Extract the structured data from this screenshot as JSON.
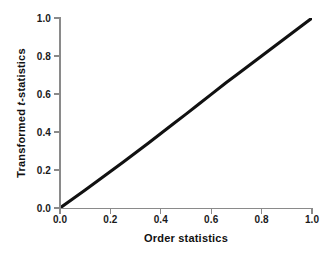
{
  "chart_data": {
    "type": "line",
    "title": "",
    "subtitle": "",
    "xlabel": "Order statistics",
    "ylabel": "Transformed t-statistics",
    "ylabel_parts": {
      "prefix": "Transformed ",
      "italic": "t",
      "suffix": "-statistics"
    },
    "xlim": [
      0.0,
      1.0
    ],
    "ylim": [
      0.0,
      1.0
    ],
    "xticks": [
      "0.0",
      "0.2",
      "0.4",
      "0.6",
      "0.8",
      "1.0"
    ],
    "yticks": [
      "0.0",
      "0.2",
      "0.4",
      "0.6",
      "0.8",
      "1.0"
    ],
    "xtick_values": [
      0.0,
      0.2,
      0.4,
      0.6,
      0.8,
      1.0
    ],
    "ytick_values": [
      0.0,
      0.2,
      0.4,
      0.6,
      0.8,
      1.0
    ],
    "grid": false,
    "legend": false,
    "legend_position": "none",
    "line_color": "#111111",
    "axis_color": "#8a8a8a",
    "background_color": "#ffffff",
    "annotations": [],
    "series": [
      {
        "name": "Transformed t-statistics vs order statistics",
        "x": [
          0.0,
          0.05,
          0.1,
          0.15,
          0.2,
          0.25,
          0.3,
          0.35,
          0.4,
          0.45,
          0.5,
          0.55,
          0.6,
          0.66,
          0.7,
          0.75,
          0.8,
          0.85,
          0.9,
          0.95,
          1.0
        ],
        "values": [
          0.0,
          0.047,
          0.095,
          0.143,
          0.192,
          0.241,
          0.291,
          0.341,
          0.392,
          0.443,
          0.494,
          0.546,
          0.598,
          0.661,
          0.7,
          0.75,
          0.8,
          0.85,
          0.9,
          0.95,
          1.0
        ]
      }
    ]
  },
  "axes": {
    "x_title": "Order statistics",
    "y_title_prefix": "Transformed ",
    "y_title_italic": "t",
    "y_title_suffix": "-statistics"
  }
}
